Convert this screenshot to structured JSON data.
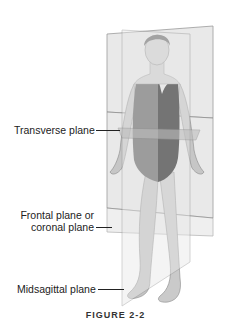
{
  "figure": {
    "labels": {
      "transverse": "Transverse plane",
      "frontal_line1": "Frontal plane or",
      "frontal_line2": "coronal plane",
      "midsagittal": "Midsagittal plane"
    },
    "caption": "FIGURE 2-2",
    "colors": {
      "plane_fill": "#e4e4e4",
      "plane_edge": "#8a8a8a",
      "skin": "#c8c8c8",
      "swimsuit_left": "#5e5e5e",
      "swimsuit_right": "#151515",
      "hair": "#6a6a6a"
    }
  }
}
